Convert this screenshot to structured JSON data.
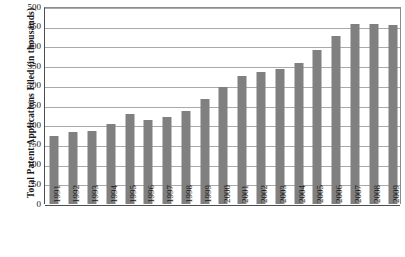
{
  "chart_data": {
    "type": "bar",
    "title": "",
    "xlabel": "",
    "ylabel": "Total Patent Applications Filed (in thousands)",
    "ylim": [
      0,
      500
    ],
    "y_ticks": [
      0,
      50,
      100,
      150,
      200,
      250,
      300,
      350,
      400,
      450,
      500
    ],
    "grid": "horizontal",
    "legend": "none",
    "bar_color": "#808080",
    "categories": [
      "1991",
      "1992",
      "1993",
      "1994",
      "1995",
      "1996",
      "1997",
      "1998",
      "1999",
      "2000",
      "2001",
      "2002",
      "2003",
      "2004",
      "2005",
      "2006",
      "2007",
      "2008",
      "2009"
    ],
    "values": [
      172,
      184,
      185,
      202,
      228,
      212,
      221,
      237,
      266,
      296,
      326,
      334,
      342,
      357,
      391,
      426,
      456,
      457,
      455
    ]
  },
  "axes": {
    "y_title": "Total  Patent  Applications  Filed  (in  thousands)",
    "y_tick_labels": [
      "500",
      "450",
      "400",
      "350",
      "300",
      "250",
      "200",
      "150",
      "100",
      "50",
      "0"
    ],
    "x_tick_labels": [
      "1991",
      "1992",
      "1993",
      "1994",
      "1995",
      "1996",
      "1997",
      "1998",
      "1999",
      "2000",
      "2001",
      "2002",
      "2003",
      "2004",
      "2005",
      "2006",
      "2007",
      "2008",
      "2009"
    ]
  }
}
